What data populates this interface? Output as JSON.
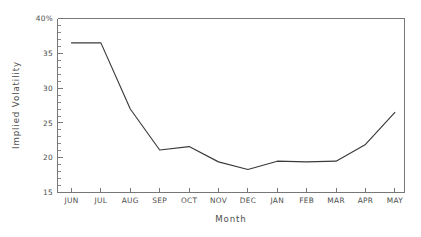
{
  "chart_data": {
    "type": "line",
    "title": "",
    "subtitle": "",
    "xlabel": "Month",
    "ylabel": "Implied Volatility",
    "categories": [
      "JUN",
      "JUL",
      "AUG",
      "SEP",
      "OCT",
      "NOV",
      "DEC",
      "JAN",
      "FEB",
      "MAR",
      "APR",
      "MAY"
    ],
    "values": [
      36.5,
      36.5,
      27.0,
      21.1,
      21.6,
      19.4,
      18.3,
      19.5,
      19.4,
      19.5,
      21.9,
      26.5
    ],
    "series": [
      {
        "name": "Implied Volatility",
        "values": [
          36.5,
          36.5,
          27.0,
          21.1,
          21.6,
          19.4,
          18.3,
          19.5,
          19.4,
          19.5,
          21.9,
          26.5
        ],
        "color": "#3a3a3a"
      }
    ],
    "ylim": [
      15,
      40
    ],
    "xlim": [
      0,
      11
    ],
    "ytick_values": [
      15,
      20,
      25,
      30,
      35,
      40
    ],
    "ytick_labels": [
      "15",
      "20",
      "25",
      "30",
      "35",
      "40%"
    ],
    "ytick_minor_step": 1,
    "grid": false,
    "legend": false,
    "legend_position": "none",
    "markers": false,
    "axis_color": "#777777",
    "line_color": "#3a3a3a",
    "background": "#ffffff",
    "annotations": []
  },
  "axes": {
    "y_title": "Implied Volatility",
    "x_title": "Month"
  }
}
